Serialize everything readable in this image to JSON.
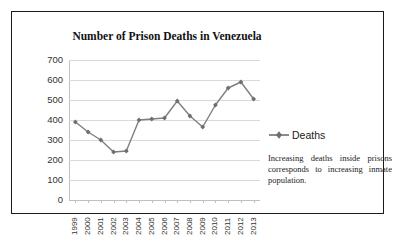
{
  "chart_data": {
    "type": "line",
    "title": "Number of Prison Deaths in Venezuela",
    "xlabel": "",
    "ylabel": "",
    "categories": [
      "1999",
      "2000",
      "2001",
      "2002",
      "2003",
      "2004",
      "2005",
      "2006",
      "2007",
      "2008",
      "2009",
      "2010",
      "2011",
      "2012",
      "2013"
    ],
    "series": [
      {
        "name": "Deaths",
        "values": [
          390,
          340,
          300,
          240,
          245,
          400,
          405,
          410,
          495,
          420,
          365,
          475,
          560,
          590,
          505
        ],
        "color": "#7f7f7f",
        "marker": "diamond"
      }
    ],
    "ylim": [
      0,
      700
    ],
    "ytick_step": 100,
    "yticks": [
      "700",
      "600",
      "500",
      "400",
      "300",
      "200",
      "100",
      "0"
    ],
    "grid": true,
    "legend_position": "right"
  },
  "legend": {
    "label": "Deaths"
  },
  "annotation": {
    "text": "Increasing deaths inside prisons corresponds to increasing inmate population."
  },
  "colors": {
    "series": "#7f7f7f",
    "gridline": "#d9d9d9",
    "axis": "#bfbfbf",
    "border": "#1a1a1a",
    "text": "#333333"
  }
}
